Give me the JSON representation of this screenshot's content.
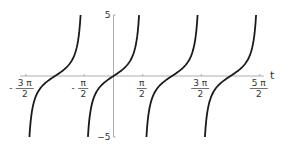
{
  "chart_data": {
    "type": "line",
    "title": "",
    "xlabel": "t",
    "ylabel": "",
    "function": "tan(t)",
    "xlim": [
      -5.0,
      8.5
    ],
    "ylim": [
      -5,
      5
    ],
    "grid": false,
    "legend": null,
    "x_ticks": [
      {
        "value": -4.712,
        "num": "3 π",
        "den": "2",
        "sign": "-"
      },
      {
        "value": -1.571,
        "num": "π",
        "den": "2",
        "sign": "-"
      },
      {
        "value": 1.571,
        "num": "π",
        "den": "2",
        "sign": ""
      },
      {
        "value": 4.712,
        "num": "3 π",
        "den": "2",
        "sign": ""
      },
      {
        "value": 7.854,
        "num": "5 π",
        "den": "2",
        "sign": ""
      }
    ],
    "y_ticks": [
      {
        "value": 5,
        "label": "5"
      },
      {
        "value": -5,
        "label": "−5"
      }
    ],
    "series": [
      {
        "name": "branch-1",
        "x_range": [
          -4.516,
          -1.768
        ],
        "y_range": [
          -5,
          5
        ],
        "zero_at": -3.1416
      },
      {
        "name": "branch-2",
        "x_range": [
          -1.373,
          1.373
        ],
        "y_range": [
          -5,
          5
        ],
        "zero_at": 0
      },
      {
        "name": "branch-3",
        "x_range": [
          1.768,
          4.516
        ],
        "y_range": [
          -5,
          5
        ],
        "zero_at": 3.1416
      },
      {
        "name": "branch-4",
        "x_range": [
          4.909,
          7.657
        ],
        "y_range": [
          -5,
          5
        ],
        "zero_at": 6.2832
      }
    ],
    "line_color": "#1a1a1a",
    "axis_color": "#999999"
  }
}
